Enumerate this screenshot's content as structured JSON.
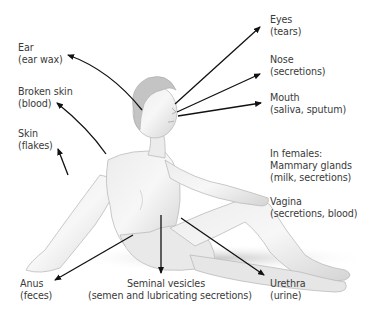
{
  "diagram": {
    "labels": [
      {
        "id": "eyes",
        "title": "Eyes",
        "detail": "(tears)"
      },
      {
        "id": "ear",
        "title": "Ear",
        "detail": "(ear wax)"
      },
      {
        "id": "nose",
        "title": "Nose",
        "detail": "(secretions)"
      },
      {
        "id": "broken-skin",
        "title": "Broken skin",
        "detail": "(blood)"
      },
      {
        "id": "mouth",
        "title": "Mouth",
        "detail": "(saliva, sputum)"
      },
      {
        "id": "skin",
        "title": "Skin",
        "detail": "(flakes)"
      },
      {
        "id": "females",
        "title": "In females:",
        "title2": "Mammary glands",
        "detail": "(milk, secretions)"
      },
      {
        "id": "vagina",
        "title": "Vagina",
        "detail": "(secretions, blood)"
      },
      {
        "id": "anus",
        "title": "Anus",
        "detail": "(feces)"
      },
      {
        "id": "seminal",
        "title": "Seminal vesicles",
        "detail": "(semen and lubricating secretions)"
      },
      {
        "id": "urethra",
        "title": "Urethra",
        "detail": "(urine)"
      }
    ],
    "colors": {
      "arrow": "#111111",
      "text": "#3a3a3a",
      "skin_light": "#f2f2f2",
      "skin_shade": "#c9c9c9",
      "hair": "#bdbdbd"
    }
  }
}
